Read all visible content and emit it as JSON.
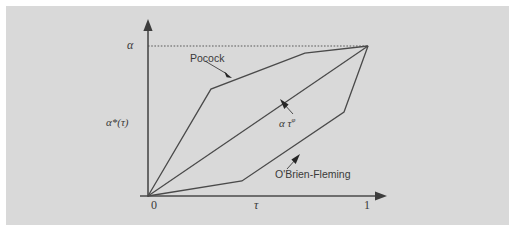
{
  "figure": {
    "background_color": "#ffffff",
    "panel_color": "#d9d9d9",
    "line_color": "#4a4a4a",
    "text_color": "#3a3a3a"
  },
  "axes": {
    "y_axis_top_label": "α",
    "y_axis_label": "α*(τ)",
    "x_axis_label": "τ",
    "x_tick_origin": "0",
    "x_tick_end": "1"
  },
  "annotations": {
    "pocock": "Pocock",
    "power_alpha": "α τ",
    "power_exponent": "φ",
    "obrien_fleming": "O'Brien-Fleming"
  },
  "chart_data": {
    "type": "line",
    "title": "",
    "xlabel": "τ",
    "ylabel": "α*(τ)",
    "xlim": [
      0,
      1
    ],
    "ylim": [
      0,
      1
    ],
    "xticks": [
      0,
      1
    ],
    "xticklabels": [
      "0",
      "1"
    ],
    "yticks": [
      1
    ],
    "yticklabels": [
      "α"
    ],
    "grid": false,
    "legend": "inline-annotations",
    "reference_line": {
      "type": "horizontal-dotted",
      "y": 1,
      "label": "α",
      "from_x": 0,
      "to_x": 1
    },
    "series": [
      {
        "name": "Pocock",
        "label": "Pocock",
        "x": [
          0.0,
          0.286,
          0.713,
          1.0
        ],
        "y": [
          0.0,
          0.713,
          0.953,
          1.0
        ]
      },
      {
        "name": "alpha tau^phi",
        "label": "α τᵠ",
        "x": [
          0.0,
          1.0
        ],
        "y": [
          0.0,
          1.0
        ]
      },
      {
        "name": "O'Brien-Fleming",
        "label": "O'Brien-Fleming",
        "x": [
          0.0,
          0.427,
          0.891,
          1.0
        ],
        "y": [
          0.0,
          0.1,
          0.56,
          1.0
        ]
      }
    ]
  }
}
